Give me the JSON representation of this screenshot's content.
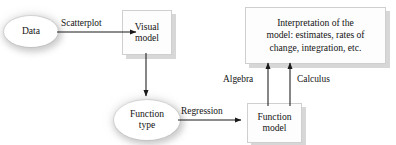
{
  "diagram": {
    "nodes": [
      {
        "id": "data",
        "shape": "ellipse",
        "label": "Data"
      },
      {
        "id": "visual_model",
        "shape": "rectangle",
        "label": "Visual\nmodel"
      },
      {
        "id": "function_type",
        "shape": "ellipse",
        "label": "Function\ntype"
      },
      {
        "id": "function_model",
        "shape": "rectangle",
        "label": "Function\nmodel"
      },
      {
        "id": "interpretation",
        "shape": "rectangle",
        "label": "Interpretation of the\nmodel: estimates, rates of\nchange, integration, etc."
      }
    ],
    "edges": [
      {
        "id": "data_to_visual",
        "from": "data",
        "to": "visual_model",
        "label": "Scatterplot",
        "direction": "right"
      },
      {
        "id": "visual_to_function_type",
        "from": "visual_model",
        "to": "function_type",
        "label": "",
        "direction": "down"
      },
      {
        "id": "function_type_to_model",
        "from": "function_type",
        "to": "function_model",
        "label": "Regression",
        "direction": "right"
      },
      {
        "id": "model_to_interp_algebra",
        "from": "function_model",
        "to": "interpretation",
        "label": "Algebra",
        "direction": "up"
      },
      {
        "id": "model_to_interp_calculus",
        "from": "function_model",
        "to": "interpretation",
        "label": "Calculus",
        "direction": "up"
      }
    ],
    "colors": {
      "background": "#ffffff",
      "text": "#141414",
      "arrow": "#1a1a1a",
      "box_border": "#cfcfcf",
      "box_shadow": "#d0d0d0"
    }
  }
}
